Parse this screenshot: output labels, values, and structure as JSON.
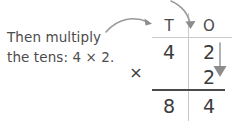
{
  "caption": {
    "line1": "Then multiply",
    "line2": "the tens: 4 × 2."
  },
  "place_value_chart": {
    "headers": {
      "tens": "T",
      "ones": "O"
    },
    "rows": [
      {
        "name": "multiplicand",
        "tens": "4",
        "ones": "2"
      },
      {
        "name": "multiplier",
        "tens": "",
        "ones": "2"
      },
      {
        "name": "product",
        "tens": "8",
        "ones": "4"
      }
    ],
    "operator": "×"
  },
  "annotations": {
    "arrow_to_tens": "curved-arrow-pointing-right-to-tens-column",
    "arrow_to_ones": "curved-arrow-pointing-down-to-ones-column",
    "arrow_down_ones": "straight-down-arrow-beside-ones-column"
  },
  "colors": {
    "text": "#4c4c4c",
    "digits": "#3c3c3c",
    "rule_light": "#c9c9c9",
    "rule_dark": "#4a4a4a",
    "arrow": "#8c8c8c",
    "background": "#ffffff"
  }
}
